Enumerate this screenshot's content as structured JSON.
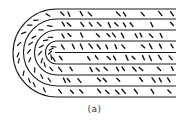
{
  "figure": {
    "caption": "(a)",
    "stroke_color": "#1a1a1a",
    "dash_color": "#111111",
    "center": {
      "x": 57,
      "y": 53
    },
    "right_edge": 176,
    "layers": [
      {
        "top_y": 9,
        "bottom_y": 97
      },
      {
        "top_y": 19,
        "bottom_y": 86
      },
      {
        "top_y": 30,
        "bottom_y": 75
      },
      {
        "top_y": 41,
        "bottom_y": 64
      }
    ],
    "center_line": {
      "y": 52.5,
      "x_start": 55
    },
    "straight_rows": [
      14,
      24.5,
      35.5,
      46.5,
      58,
      69,
      80,
      91.5
    ],
    "dash_columns": [
      62,
      71,
      80,
      89,
      98,
      107,
      116,
      125,
      134,
      143,
      152,
      161,
      170
    ],
    "arc_rings": [
      {
        "radius": 39,
        "count": 11
      },
      {
        "radius": 28,
        "count": 9
      },
      {
        "radius": 17,
        "count": 7
      },
      {
        "radius": 7,
        "count": 5
      }
    ]
  }
}
